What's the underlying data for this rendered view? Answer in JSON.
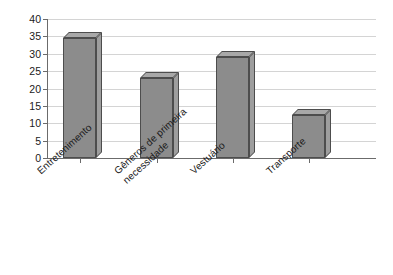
{
  "chart_data": {
    "type": "bar",
    "title": "",
    "subtitle": "",
    "xlabel": "",
    "ylabel": "",
    "categories": [
      "Entretenimento",
      "Gêneros de primeira\nnecessidade",
      "Vestuário",
      "Transporte"
    ],
    "values": [
      34.5,
      23,
      29,
      12.5
    ],
    "ylim": [
      0,
      40
    ],
    "yticks": [
      0,
      5,
      10,
      15,
      20,
      25,
      30,
      35,
      40
    ],
    "ytick_labels": [
      "0",
      "5",
      "10",
      "15",
      "20",
      "25",
      "30",
      "35",
      "40"
    ],
    "grid": true,
    "grid_axis": "y",
    "legend": false,
    "legend_position": "none",
    "style": "3d-bar",
    "colors": {
      "bar_front": "#8c8c8c",
      "bar_top": "#a8a8a8",
      "bar_side": "#9e9e9e",
      "bar_outline": "#4d4d4d",
      "gridline": "#d4d4d4",
      "axis": "#6b6b6b",
      "text": "#1a1a1a",
      "background": "#ffffff"
    }
  }
}
